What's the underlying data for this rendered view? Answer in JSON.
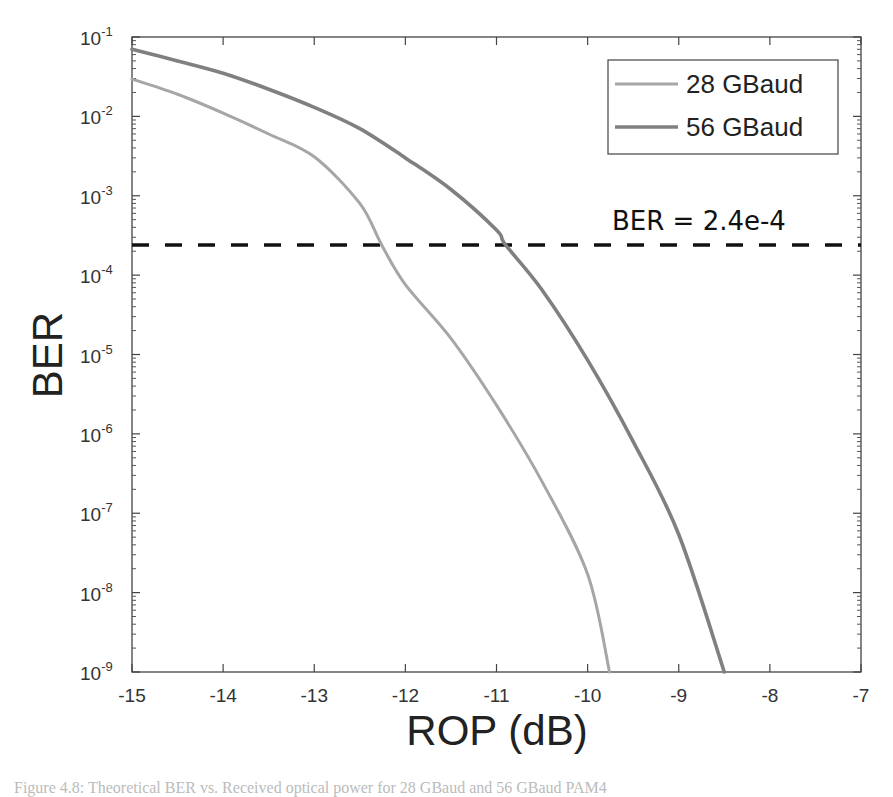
{
  "chart_data": {
    "type": "line",
    "title": "",
    "xlabel": "ROP (dB)",
    "ylabel": "BER",
    "xlim": [
      -15,
      -7
    ],
    "ylim": [
      1e-09,
      0.1
    ],
    "yscale": "log",
    "grid": false,
    "legend_position": "upper right",
    "x_ticks": [
      -15,
      -14,
      -13,
      -12,
      -11,
      -10,
      -9,
      -8,
      -7
    ],
    "x_tick_labels": [
      "-15",
      "-14",
      "-13",
      "-12",
      "-11",
      "-10",
      "-9",
      "-8",
      "-7"
    ],
    "y_ticks": [
      -1,
      -2,
      -3,
      -4,
      -5,
      -6,
      -7,
      -8,
      -9
    ],
    "y_tick_labels": [
      "10^-1",
      "10^-2",
      "10^-3",
      "10^-4",
      "10^-5",
      "10^-6",
      "10^-7",
      "10^-8",
      "10^-9"
    ],
    "series": [
      {
        "name": "28 GBaud",
        "color": "#a6a6a6",
        "x": [
          -15,
          -14.5,
          -14,
          -13.5,
          -13,
          -12.5,
          -12.26,
          -12,
          -11.5,
          -11,
          -10.5,
          -10,
          -9.76
        ],
        "y": [
          0.0295,
          0.019,
          0.011,
          0.006,
          0.0031,
          0.0008,
          0.00024,
          7.6e-05,
          1.6e-05,
          2.3e-06,
          2.5e-07,
          1.7e-08,
          1e-09
        ]
      },
      {
        "name": "56 GBaud",
        "color": "#808080",
        "x": [
          -15,
          -14.5,
          -14,
          -13.5,
          -13,
          -12.5,
          -12,
          -11.5,
          -11,
          -10.9,
          -10.5,
          -10,
          -9.5,
          -9,
          -8.5
        ],
        "y": [
          0.07,
          0.05,
          0.035,
          0.022,
          0.013,
          0.007,
          0.003,
          0.0012,
          0.00037,
          0.00024,
          6.5e-05,
          8.5e-06,
          8e-07,
          5.4e-08,
          1e-09
        ]
      }
    ],
    "reference_lines": [
      {
        "type": "horizontal",
        "y": 0.00024,
        "style": "dashed",
        "color": "#111111",
        "label": "BER = 2.4e-4"
      }
    ],
    "annotations": [
      {
        "text": "BER = 2.4e-4",
        "x": -9.8,
        "y": 0.00045
      }
    ]
  },
  "legend": {
    "items": [
      {
        "label": "28 GBaud",
        "color": "#a6a6a6"
      },
      {
        "label": "56 GBaud",
        "color": "#808080"
      }
    ]
  },
  "labels": {
    "xlabel": "ROP (dB)",
    "ylabel": "BER",
    "threshold": "BER = 2.4e-4",
    "caption": "Figure 4.8:  Theoretical BER vs. Received optical power for 28 GBaud and 56 GBaud PAM4"
  }
}
